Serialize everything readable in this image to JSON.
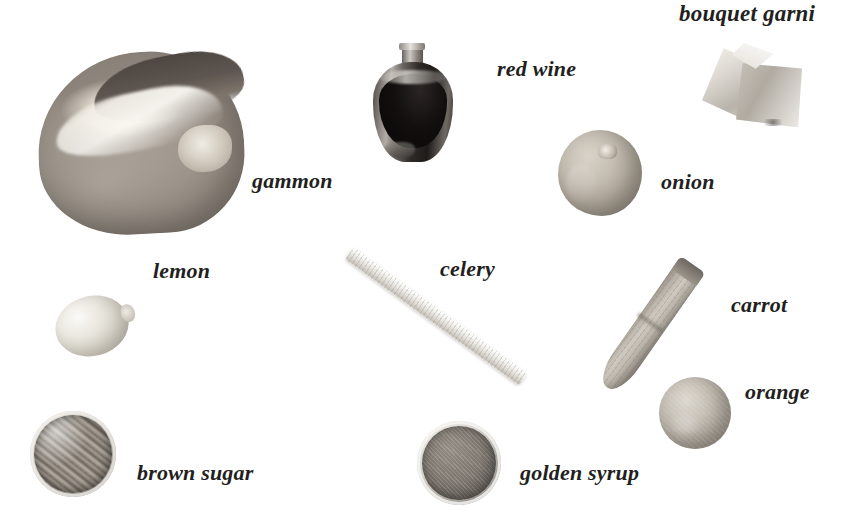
{
  "page": {
    "width": 866,
    "height": 513,
    "background": "#ffffff",
    "style": "grayscale photographic ingredient layout with handwritten-style italic serif captions"
  },
  "labels": {
    "gammon": "gammon",
    "red_wine": "red wine",
    "bouquet_garni": "bouquet garni",
    "onion": "onion",
    "lemon": "lemon",
    "celery": "celery",
    "carrot": "carrot",
    "orange": "orange",
    "brown_sugar": "brown sugar",
    "golden_syrup": "golden syrup"
  },
  "ingredients": [
    {
      "id": "gammon",
      "label": "gammon",
      "shape": "ham-joint",
      "x": 38,
      "y": 52,
      "w": 206,
      "h": 182
    },
    {
      "id": "red-wine",
      "label": "red wine",
      "shape": "jug",
      "x": 373,
      "y": 44,
      "w": 80,
      "h": 118
    },
    {
      "id": "bouquet-garni",
      "label": "bouquet garni",
      "shape": "muslin-bag",
      "x": 702,
      "y": 43,
      "w": 100,
      "h": 88
    },
    {
      "id": "onion",
      "label": "onion",
      "shape": "sphere",
      "x": 558,
      "y": 130,
      "w": 84,
      "h": 86
    },
    {
      "id": "lemon",
      "label": "lemon",
      "shape": "ellipse",
      "x": 55,
      "y": 296,
      "w": 80,
      "h": 60
    },
    {
      "id": "celery",
      "label": "celery",
      "shape": "stick",
      "x": 340,
      "y": 248,
      "w": 185,
      "h": 132
    },
    {
      "id": "carrot",
      "label": "carrot",
      "shape": "root",
      "x": 598,
      "y": 258,
      "w": 104,
      "h": 136
    },
    {
      "id": "orange",
      "label": "orange",
      "shape": "sphere",
      "x": 659,
      "y": 377,
      "w": 72,
      "h": 72
    },
    {
      "id": "brown-sugar",
      "label": "brown sugar",
      "shape": "bowl",
      "x": 30,
      "y": 411,
      "w": 86,
      "h": 86
    },
    {
      "id": "golden-syrup",
      "label": "golden syrup",
      "shape": "bowl",
      "x": 417,
      "y": 421,
      "w": 84,
      "h": 84
    }
  ],
  "label_positions": [
    {
      "id": "gammon",
      "x": 252,
      "y": 170,
      "size": 22
    },
    {
      "id": "red-wine",
      "x": 497,
      "y": 58,
      "size": 22
    },
    {
      "id": "bouquet-garni",
      "x": 679,
      "y": 2,
      "size": 23
    },
    {
      "id": "onion",
      "x": 661,
      "y": 171,
      "size": 22
    },
    {
      "id": "lemon",
      "x": 153,
      "y": 260,
      "size": 22
    },
    {
      "id": "celery",
      "x": 440,
      "y": 258,
      "size": 22
    },
    {
      "id": "carrot",
      "x": 731,
      "y": 294,
      "size": 22
    },
    {
      "id": "orange",
      "x": 745,
      "y": 381,
      "size": 22
    },
    {
      "id": "brown-sugar",
      "x": 137,
      "y": 462,
      "size": 22
    },
    {
      "id": "golden-syrup",
      "x": 520,
      "y": 462,
      "size": 22
    }
  ],
  "colors": {
    "text": "#231f1e",
    "background": "#ffffff",
    "ink_light": "#d8d3ca",
    "ink_mid": "#a49c92",
    "ink_dark": "#4d4642"
  }
}
